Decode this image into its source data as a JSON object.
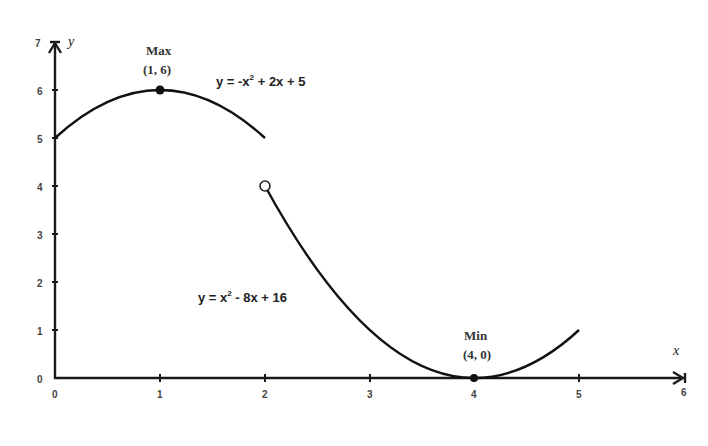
{
  "chart_data": {
    "type": "line",
    "title": "",
    "xlabel": "x",
    "ylabel": "y",
    "xlim": [
      0,
      6
    ],
    "ylim": [
      0,
      7
    ],
    "grid": false,
    "x_ticks": [
      "0",
      "1",
      "2",
      "3",
      "4",
      "5",
      "6"
    ],
    "y_ticks": [
      "0",
      "1",
      "2",
      "3",
      "4",
      "5",
      "6",
      "7"
    ],
    "series": [
      {
        "name": "y = -x² + 2x + 5",
        "domain": [
          0,
          2
        ],
        "x": [
          0,
          0.5,
          1,
          1.5,
          2
        ],
        "values": [
          5,
          5.75,
          6,
          5.75,
          5
        ]
      },
      {
        "name": "y = x² - 8x + 16",
        "domain": [
          2,
          5
        ],
        "x": [
          2,
          2.5,
          3,
          3.5,
          4,
          4.5,
          5
        ],
        "values": [
          4,
          2.25,
          1,
          0.25,
          0,
          0.25,
          1
        ]
      }
    ],
    "points": [
      {
        "x": 1,
        "y": 6,
        "style": "filled",
        "label": "Max",
        "coords": "(1, 6)"
      },
      {
        "x": 2,
        "y": 4,
        "style": "open"
      },
      {
        "x": 4,
        "y": 0,
        "style": "filled",
        "label": "Min",
        "coords": "(4, 0)"
      }
    ],
    "annotations": [
      {
        "text": "y = -x² + 2x + 5",
        "near": "series 1"
      },
      {
        "text": "y = x² - 8x + 16",
        "near": "series 2"
      }
    ]
  },
  "labels": {
    "x_axis": "x",
    "y_axis": "y",
    "max_title": "Max",
    "max_coords": "(1, 6)",
    "min_title": "Min",
    "min_coords": "(4, 0)",
    "eq1_prefix": "y = -x",
    "eq1_sup": "2",
    "eq1_suffix": " + 2x + 5",
    "eq2_prefix": "y = x",
    "eq2_sup": "2",
    "eq2_suffix": " - 8x + 16",
    "x_ticks": [
      "0",
      "1",
      "2",
      "3",
      "4",
      "5",
      "6"
    ],
    "y_ticks": [
      "0",
      "1",
      "2",
      "3",
      "4",
      "5",
      "6",
      "7"
    ]
  }
}
